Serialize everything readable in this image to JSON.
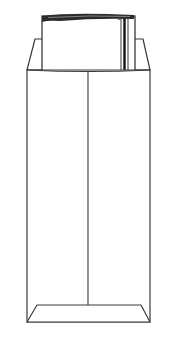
{
  "illustration": {
    "title": "Open-end envelope with documents",
    "subject": "envelope",
    "contents": "folded papers",
    "colors": {
      "background": "#ffffff",
      "stroke": "#3a3a3a",
      "dark_edge": "#1a1a1a",
      "fill": "#ffffff"
    }
  }
}
